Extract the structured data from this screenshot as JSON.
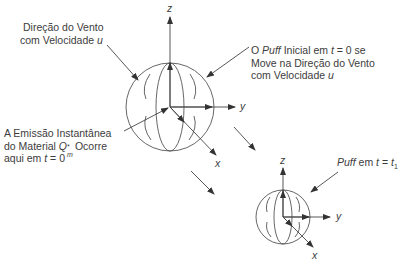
{
  "diagram": {
    "type": "puff-dispersion-schematic",
    "labels": {
      "wind": {
        "line1": "Direção do Vento",
        "line2_pre": "com Velocidade ",
        "line2_var": "u"
      },
      "initial_puff": {
        "line1_pre": "O ",
        "line1_puff": "Puff",
        "line1_mid": " Inicial em ",
        "line1_t": "t",
        "line1_post": " = 0 se",
        "line2": "Move na Direção do Vento",
        "line3_pre": "com Velocidade ",
        "line3_var": "u"
      },
      "emission": {
        "line1": "A Emissão Instantânea",
        "line2_pre": "do Material ",
        "line2_q": "Q",
        "line2_sup": "*",
        "line2_sub": "m",
        "line2_post": " Ocorre",
        "line3_pre": "aqui em ",
        "line3_t": "t",
        "line3_post": " = 0"
      },
      "later_puff": {
        "puff": "Puff",
        "mid": " em ",
        "t": "t",
        "eq": " = ",
        "t1": "t",
        "sub": "1"
      }
    },
    "axes": {
      "large": {
        "x": "x",
        "y": "y",
        "z": "z"
      },
      "small": {
        "x": "x",
        "y": "y",
        "z": "z"
      }
    },
    "colors": {
      "line": "#4a4a4a",
      "text": "#3c3c3c",
      "background": "#ffffff"
    }
  }
}
